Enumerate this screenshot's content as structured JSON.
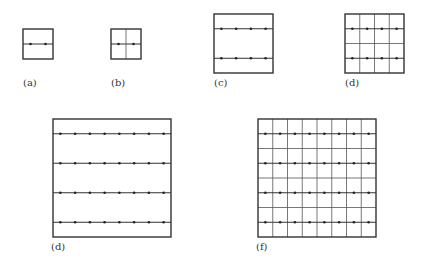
{
  "figure": {
    "colors": {
      "frame": "#333333",
      "line": "#555555",
      "dot": "#222222",
      "background": "#ffffff"
    },
    "panels": [
      {
        "id": "a",
        "label": "(a)",
        "x": 23,
        "y": 29,
        "size": 30,
        "rows": 1,
        "cols": 2,
        "vgrid": false,
        "hgrid": false,
        "label_x": 23,
        "label_y": 77
      },
      {
        "id": "b",
        "label": "(b)",
        "x": 111,
        "y": 29,
        "size": 30,
        "rows": 1,
        "cols": 2,
        "vgrid": true,
        "hgrid": false,
        "label_x": 111,
        "label_y": 77
      },
      {
        "id": "c",
        "label": "(c)",
        "x": 214,
        "y": 14,
        "size": 59,
        "rows": 2,
        "cols": 4,
        "vgrid": false,
        "hgrid": false,
        "label_x": 214,
        "label_y": 77
      },
      {
        "id": "d1",
        "label": "(d)",
        "x": 345,
        "y": 14,
        "size": 59,
        "rows": 2,
        "cols": 4,
        "vgrid": true,
        "hgrid": true,
        "label_x": 345,
        "label_y": 77
      },
      {
        "id": "d2",
        "label": "(d)",
        "x": 53,
        "y": 119,
        "size": 118,
        "rows": 4,
        "cols": 8,
        "vgrid": false,
        "hgrid": false,
        "label_x": 51,
        "label_y": 241
      },
      {
        "id": "f",
        "label": "(f)",
        "x": 258,
        "y": 119,
        "size": 118,
        "rows": 4,
        "cols": 8,
        "vgrid": true,
        "hgrid": true,
        "label_x": 256,
        "label_y": 241
      }
    ]
  }
}
